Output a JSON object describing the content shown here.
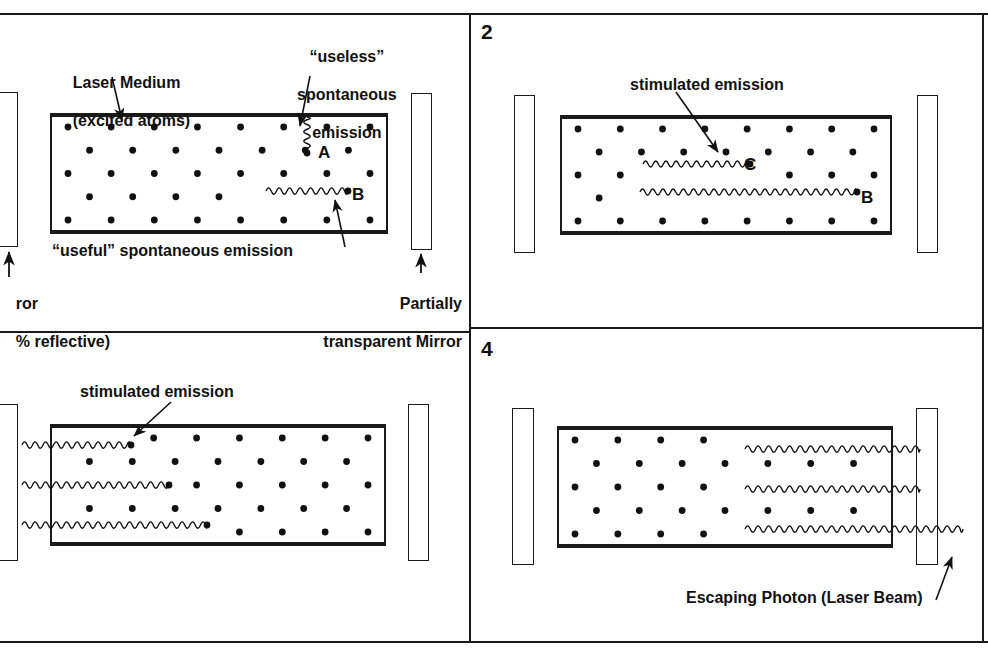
{
  "figure": {
    "type": "four-panel-diagram",
    "background_color": "#ffffff",
    "ink_color": "#111111"
  },
  "panels": [
    {
      "number": "",
      "id": "panel-1",
      "labels": {
        "medium": "Laser Medium\n(excited atoms)",
        "medium_line1": "Laser Medium",
        "medium_line2": "(excited atoms)",
        "useless": "“useless”\nspontaneous\nemission",
        "useless_line1": "“useless”",
        "useless_line2": "spontaneous",
        "useless_line3": "emission",
        "useful": "“useful” spontaneous emission",
        "left_mirror_line1": "ror",
        "left_mirror_line2": "% reflective)",
        "right_mirror_line1": "Partially",
        "right_mirror_line2": "transparent Mirror"
      },
      "point_labels": [
        "A",
        "B"
      ]
    },
    {
      "number": "2",
      "id": "panel-2",
      "labels": {
        "stimulated": "stimulated emission"
      },
      "point_labels": [
        "C",
        "B"
      ]
    },
    {
      "number": "",
      "id": "panel-3",
      "labels": {
        "stimulated": "stimulated emission"
      },
      "point_labels": []
    },
    {
      "number": "4",
      "id": "panel-4",
      "labels": {
        "escaping": "Escaping Photon (Laser Beam)"
      },
      "point_labels": []
    }
  ],
  "icons": {
    "mirror": "mirror-bar-icon",
    "atom": "excited-atom-dot-icon",
    "photon": "photon-wave-icon",
    "arrow": "leader-arrow-icon"
  }
}
